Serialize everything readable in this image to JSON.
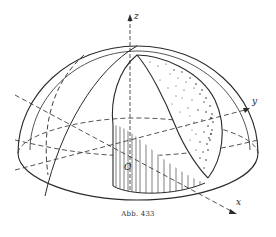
{
  "figure": {
    "caption": "Abb. 433",
    "axes": {
      "z_label": "z",
      "y_label": "y",
      "x_label": "x",
      "origin_label": "O"
    },
    "colors": {
      "ink": "#2a2a2a",
      "background": "#ffffff"
    }
  }
}
